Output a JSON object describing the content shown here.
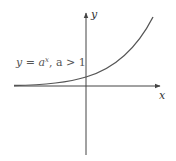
{
  "diagram": {
    "function_label": "y = a",
    "function_exponent": "x",
    "function_condition": ", a > 1",
    "x_axis_label": "x",
    "y_axis_label": "y",
    "colors": {
      "axis": "#444444",
      "curve": "#555555",
      "text": "#555555"
    }
  }
}
